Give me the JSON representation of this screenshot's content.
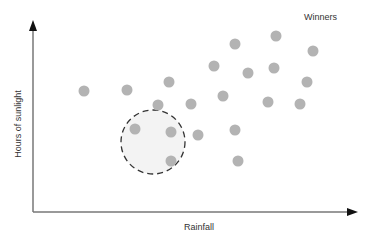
{
  "chart_data": {
    "type": "scatter",
    "title": "",
    "xlabel": "Rainfall",
    "ylabel": "Hours of sunlight",
    "grid": false,
    "legend": null,
    "annotations": [
      {
        "text": "Winners",
        "position": "top-right"
      },
      {
        "shape": "dashed-circle",
        "highlight": "low rainfall / low sunlight cluster",
        "center": [
          153,
          142
        ],
        "radius": 32
      }
    ],
    "axis_ticks": false,
    "points": [
      {
        "x": 84,
        "y": 91
      },
      {
        "x": 127,
        "y": 90
      },
      {
        "x": 169,
        "y": 82
      },
      {
        "x": 158,
        "y": 105
      },
      {
        "x": 135,
        "y": 129
      },
      {
        "x": 171,
        "y": 132
      },
      {
        "x": 171,
        "y": 161
      },
      {
        "x": 191,
        "y": 104
      },
      {
        "x": 198,
        "y": 135
      },
      {
        "x": 214,
        "y": 66
      },
      {
        "x": 223,
        "y": 96
      },
      {
        "x": 235,
        "y": 44
      },
      {
        "x": 235,
        "y": 130
      },
      {
        "x": 238,
        "y": 161
      },
      {
        "x": 248,
        "y": 73
      },
      {
        "x": 268,
        "y": 102
      },
      {
        "x": 274,
        "y": 68
      },
      {
        "x": 276,
        "y": 36
      },
      {
        "x": 300,
        "y": 104
      },
      {
        "x": 307,
        "y": 82
      },
      {
        "x": 313,
        "y": 51
      }
    ],
    "point_units": "pixel coordinates (no numeric axis scale shown)"
  },
  "labels": {
    "winners": "Winners",
    "x_axis": "Rainfall",
    "y_axis": "Hours of sunlight"
  },
  "colors": {
    "point": "#b3b3b3",
    "axis": "#666666",
    "arrow": "#111111",
    "highlight_fill": "#f3f3f3",
    "highlight_stroke": "#333333"
  }
}
